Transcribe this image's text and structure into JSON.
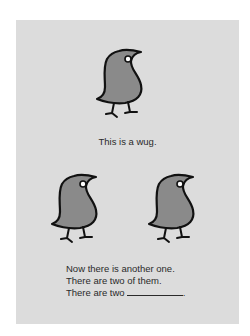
{
  "colors": {
    "card_background": "#dcdcdc",
    "bird_fill": "#8a8a8a",
    "bird_outline": "#111111",
    "text": "#2a2a2a"
  },
  "panel_one": {
    "bird_count": 1,
    "caption": "This is a wug."
  },
  "panel_two": {
    "bird_count": 2,
    "lines": [
      "Now there is another one.",
      "There are two of them.",
      "There are two"
    ],
    "blank_suffix": "."
  },
  "icons": {
    "bird": "wug-bird-icon"
  }
}
